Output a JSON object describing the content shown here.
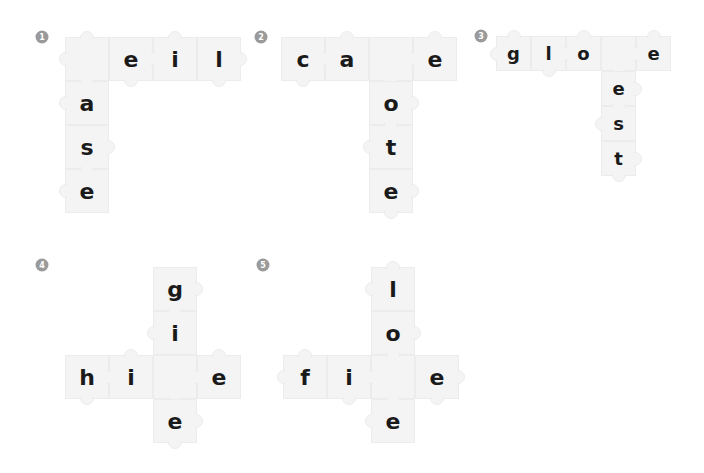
{
  "colors": {
    "piece": "#f4f4f4",
    "piece_border": "#ececec",
    "badge": "#9a9a9a",
    "letter": "#1a1a1a"
  },
  "puzzles": [
    {
      "number": "1",
      "badge": {
        "x": 42,
        "y": 37
      },
      "piece_size": 44,
      "font_size": 22,
      "pieces": [
        {
          "x": 65,
          "y": 37,
          "letter": ""
        },
        {
          "x": 109,
          "y": 37,
          "letter": "e"
        },
        {
          "x": 153,
          "y": 37,
          "letter": "i"
        },
        {
          "x": 197,
          "y": 37,
          "letter": "l"
        },
        {
          "x": 65,
          "y": 81,
          "letter": "a"
        },
        {
          "x": 65,
          "y": 125,
          "letter": "s"
        },
        {
          "x": 65,
          "y": 169,
          "letter": "e"
        }
      ]
    },
    {
      "number": "2",
      "badge": {
        "x": 261,
        "y": 37
      },
      "piece_size": 44,
      "font_size": 22,
      "pieces": [
        {
          "x": 281,
          "y": 37,
          "letter": "c"
        },
        {
          "x": 325,
          "y": 37,
          "letter": "a"
        },
        {
          "x": 369,
          "y": 37,
          "letter": ""
        },
        {
          "x": 413,
          "y": 37,
          "letter": "e"
        },
        {
          "x": 369,
          "y": 81,
          "letter": "o"
        },
        {
          "x": 369,
          "y": 125,
          "letter": "t"
        },
        {
          "x": 369,
          "y": 169,
          "letter": "e"
        }
      ]
    },
    {
      "number": "3",
      "badge": {
        "x": 481,
        "y": 36
      },
      "piece_size": 35,
      "font_size": 18,
      "pieces": [
        {
          "x": 496,
          "y": 36,
          "letter": "g"
        },
        {
          "x": 531,
          "y": 36,
          "letter": "l"
        },
        {
          "x": 566,
          "y": 36,
          "letter": "o"
        },
        {
          "x": 601,
          "y": 36,
          "letter": ""
        },
        {
          "x": 636,
          "y": 36,
          "letter": "e"
        },
        {
          "x": 601,
          "y": 71,
          "letter": "e"
        },
        {
          "x": 601,
          "y": 106,
          "letter": "s"
        },
        {
          "x": 601,
          "y": 141,
          "letter": "t"
        }
      ]
    },
    {
      "number": "4",
      "badge": {
        "x": 42,
        "y": 265
      },
      "piece_size": 44,
      "font_size": 22,
      "pieces": [
        {
          "x": 153,
          "y": 267,
          "letter": "g"
        },
        {
          "x": 153,
          "y": 311,
          "letter": "i"
        },
        {
          "x": 65,
          "y": 355,
          "letter": "h"
        },
        {
          "x": 109,
          "y": 355,
          "letter": "i"
        },
        {
          "x": 153,
          "y": 355,
          "letter": ""
        },
        {
          "x": 197,
          "y": 355,
          "letter": "e"
        },
        {
          "x": 153,
          "y": 399,
          "letter": "e"
        }
      ]
    },
    {
      "number": "5",
      "badge": {
        "x": 263,
        "y": 265
      },
      "piece_size": 44,
      "font_size": 22,
      "pieces": [
        {
          "x": 371,
          "y": 267,
          "letter": "l"
        },
        {
          "x": 371,
          "y": 311,
          "letter": "o"
        },
        {
          "x": 283,
          "y": 355,
          "letter": "f"
        },
        {
          "x": 327,
          "y": 355,
          "letter": "i"
        },
        {
          "x": 371,
          "y": 355,
          "letter": ""
        },
        {
          "x": 415,
          "y": 355,
          "letter": "e"
        },
        {
          "x": 371,
          "y": 399,
          "letter": "e"
        }
      ]
    }
  ]
}
